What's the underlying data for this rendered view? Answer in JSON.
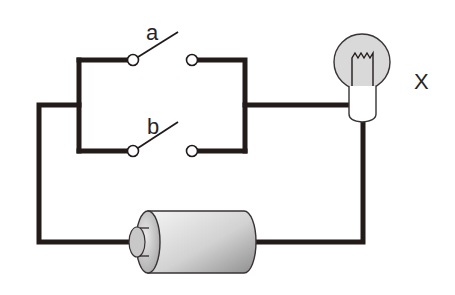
{
  "diagram": {
    "type": "electric-circuit",
    "labels": {
      "switch_a": "a",
      "switch_b": "b",
      "bulb": "X"
    },
    "components": [
      {
        "id": "switch-a",
        "kind": "switch",
        "state": "open",
        "label": "a"
      },
      {
        "id": "switch-b",
        "kind": "switch",
        "state": "open",
        "label": "b"
      },
      {
        "id": "bulb-x",
        "kind": "light-bulb",
        "label": "X"
      },
      {
        "id": "battery",
        "kind": "dry-cell-battery",
        "label": ""
      }
    ],
    "colors": {
      "wire": "#231a1a",
      "bulb_glass": "#d9d9d9",
      "battery_light": "#f2f2f2",
      "battery_dark": "#9a9a9a"
    }
  }
}
